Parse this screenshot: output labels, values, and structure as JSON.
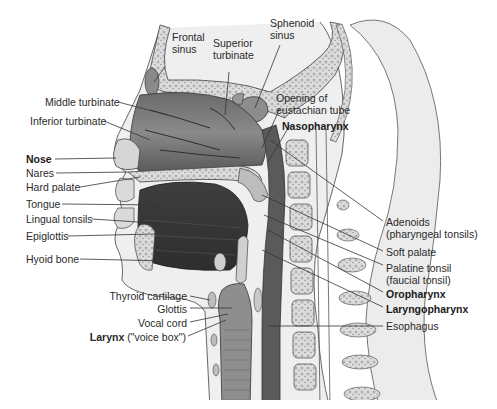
{
  "colors": {
    "background": "#ffffff",
    "label_text": "#2a2a2a",
    "leader_line": "#333333",
    "tissue_dark": "#4a4a4a",
    "tissue_mid": "#7a7a7a",
    "tissue_light": "#c8c8c8",
    "bone": "#dedede",
    "skin": "#ebebeb"
  },
  "labels": {
    "frontal_sinus": [
      "Frontal",
      "sinus"
    ],
    "sphenoid_sinus": [
      "Sphenoid",
      "sinus"
    ],
    "superior_turbinate": [
      "Superior",
      "turbinate"
    ],
    "opening_eustachian": [
      "Opening of",
      "eustachian tube"
    ],
    "nasopharynx": "Nasopharynx",
    "middle_turbinate": "Middle turbinate",
    "inferior_turbinate": "Inferior turbinate",
    "nose": "Nose",
    "nares": "Nares",
    "hard_palate": "Hard palate",
    "tongue": "Tongue",
    "lingual_tonsils": "Lingual tonsils",
    "epiglottis": "Epiglottis",
    "hyoid_bone": "Hyoid bone",
    "adenoids": [
      "Adenoids",
      "(pharyngeal tonsils)"
    ],
    "soft_palate": "Soft palate",
    "palatine_tonsil": [
      "Palatine tonsil",
      "(faucial tonsil)"
    ],
    "oropharynx": "Oropharynx",
    "laryngopharynx": "Laryngopharynx",
    "esophagus": "Esophagus",
    "thyroid_cartilage": "Thyroid cartilage",
    "glottis": "Glottis",
    "vocal_cord": "Vocal cord",
    "larynx_bold": "Larynx",
    "larynx_rest": " (\"voice box\")"
  }
}
